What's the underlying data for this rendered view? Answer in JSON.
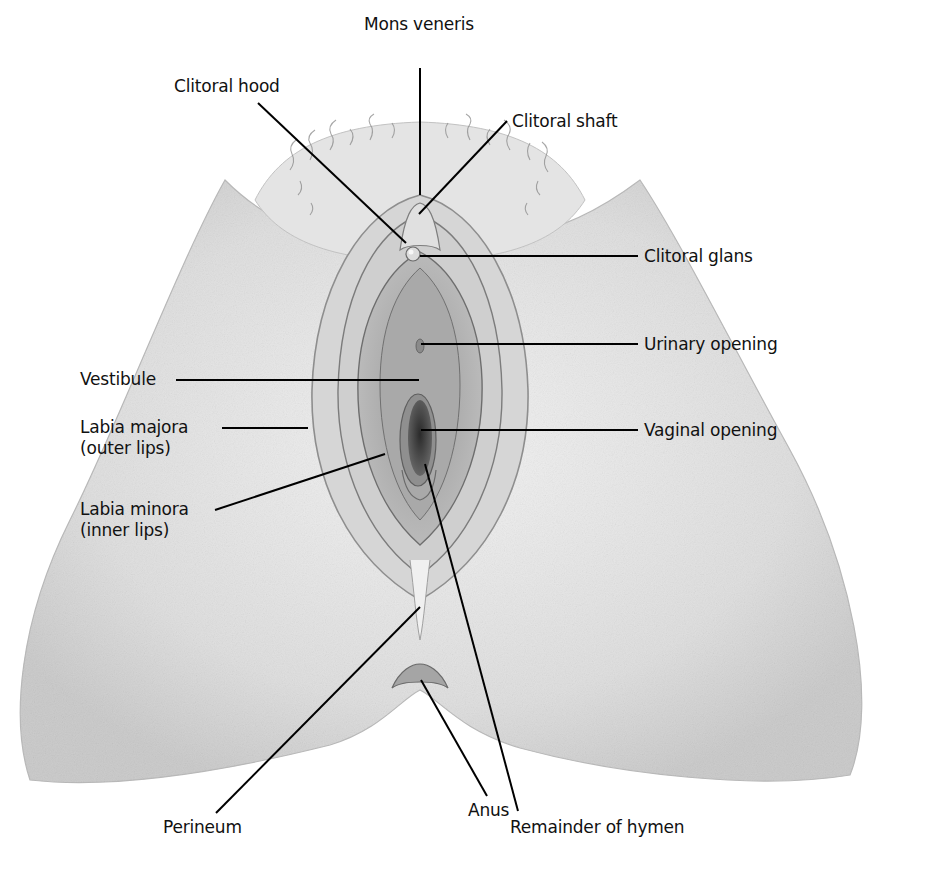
{
  "figure": {
    "type": "anatomical-illustration",
    "style": "grayscale pencil drawing"
  },
  "labels": {
    "mons_veneris": {
      "text": "Mons veneris",
      "x": 364,
      "y": 14,
      "line": [
        [
          420,
          68
        ],
        [
          420,
          195
        ]
      ]
    },
    "clitoral_hood": {
      "text": "Clitoral hood",
      "x": 174,
      "y": 76,
      "line": [
        [
          258,
          103
        ],
        [
          406,
          243
        ]
      ]
    },
    "clitoral_shaft": {
      "text": "Clitoral shaft",
      "x": 512,
      "y": 111,
      "line": [
        [
          507,
          121
        ],
        [
          419,
          214
        ]
      ]
    },
    "clitoral_glans": {
      "text": "Clitoral glans",
      "x": 644,
      "y": 249,
      "line": [
        [
          420,
          256
        ],
        [
          638,
          256
        ]
      ]
    },
    "urinary_opening": {
      "text": "Urinary opening",
      "x": 644,
      "y": 336,
      "line": [
        [
          421,
          344
        ],
        [
          638,
          344
        ]
      ]
    },
    "vestibule": {
      "text": "Vestibule",
      "x": 80,
      "y": 368,
      "line": [
        [
          176,
          380
        ],
        [
          419,
          380
        ]
      ]
    },
    "labia_majora": {
      "text": "Labia majora",
      "sub": "(outer lips)",
      "x": 80,
      "y": 416,
      "line": [
        [
          222,
          428
        ],
        [
          308,
          428
        ]
      ]
    },
    "vaginal_opening": {
      "text": "Vaginal opening",
      "x": 644,
      "y": 423,
      "line": [
        [
          421,
          430
        ],
        [
          638,
          430
        ]
      ]
    },
    "labia_minora": {
      "text": "Labia minora",
      "sub": "(inner lips)",
      "x": 80,
      "y": 501,
      "line": [
        [
          215,
          510
        ],
        [
          385,
          454
        ]
      ]
    },
    "perineum": {
      "text": "Perineum",
      "x": 163,
      "y": 813,
      "line": [
        [
          216,
          813
        ],
        [
          420,
          607
        ]
      ]
    },
    "anus": {
      "text": "Anus",
      "x": 470,
      "y": 797,
      "line": [
        [
          487,
          796
        ],
        [
          421,
          680
        ]
      ]
    },
    "remainder_of_hymen": {
      "text": "Remainder of hymen",
      "x": 511,
      "y": 813,
      "line": [
        [
          518,
          811
        ],
        [
          425,
          464
        ]
      ]
    }
  },
  "colors": {
    "leader_line": "#000000",
    "label_text": "#111111",
    "skin_light": "#e9e9e9",
    "skin_mid": "#c4c4c4",
    "skin_dark": "#7a7a7a",
    "opening_dark": "#3a3a3a"
  }
}
